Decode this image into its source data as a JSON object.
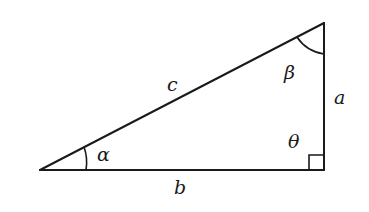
{
  "diagram": {
    "type": "right-triangle",
    "vertices": {
      "left": [
        40,
        170
      ],
      "right_angle": [
        324,
        170
      ],
      "top": [
        324,
        23
      ]
    },
    "sides": {
      "hypotenuse": "c",
      "vertical": "a",
      "horizontal": "b"
    },
    "angles": {
      "left": "α",
      "top": "β",
      "right": "θ"
    },
    "colors": {
      "stroke": "#1a1a1a",
      "background": "#ffffff"
    }
  }
}
